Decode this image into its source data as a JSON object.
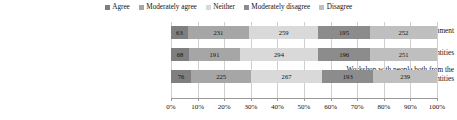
{
  "chart_data": {
    "type": "bar",
    "orientation": "horizontal",
    "stacked": true,
    "stacked_mode": "percent",
    "title": "",
    "subtitle": "",
    "xlabel": "",
    "ylabel": "",
    "grid": true,
    "legend_position": "top",
    "xlim": [
      0,
      100
    ],
    "xtick_labels": [
      "0%",
      "10%",
      "20%",
      "30%",
      "40%",
      "50%",
      "60%",
      "70%",
      "80%",
      "90%",
      "100%"
    ],
    "xtick_values": [
      0,
      10,
      20,
      30,
      40,
      50,
      60,
      70,
      80,
      90,
      100
    ],
    "categories": [
      "Workshop with people from the government",
      "Workshop with people from commercial entities",
      "Workshop with people both from the government and commercial entities"
    ],
    "series": [
      {
        "name": "Agree",
        "color": "#7f7f7f",
        "values": [
          63,
          68,
          76
        ]
      },
      {
        "name": "Moderately agree",
        "color": "#a6a6a6",
        "values": [
          231,
          191,
          225
        ]
      },
      {
        "name": "Neither",
        "color": "#d9d9d9",
        "values": [
          259,
          294,
          267
        ]
      },
      {
        "name": "Moderately disagree",
        "color": "#8c8c8c",
        "values": [
          195,
          196,
          193
        ]
      },
      {
        "name": "Disagree",
        "color": "#bfbfbf",
        "values": [
          252,
          251,
          239
        ]
      }
    ],
    "row_totals": [
      1000,
      1000,
      1000
    ],
    "data_labels": [
      [
        "63",
        "231",
        "259",
        "195",
        "252"
      ],
      [
        "68",
        "191",
        "294",
        "196",
        "251"
      ],
      [
        "76",
        "225",
        "267",
        "193",
        "239"
      ]
    ]
  },
  "legend": {
    "items": [
      {
        "label": "Agree"
      },
      {
        "label": "Moderately agree"
      },
      {
        "label": "Neither"
      },
      {
        "label": "Moderately disagree"
      },
      {
        "label": "Disagree"
      }
    ]
  },
  "category_labels": [
    {
      "line1": "Workshop with people from the government",
      "line2": ""
    },
    {
      "line1": "Workshop with people from commercial entities",
      "line2": ""
    },
    {
      "line1": "Workshop with people both from the",
      "line2": "government and commercial entities"
    }
  ]
}
